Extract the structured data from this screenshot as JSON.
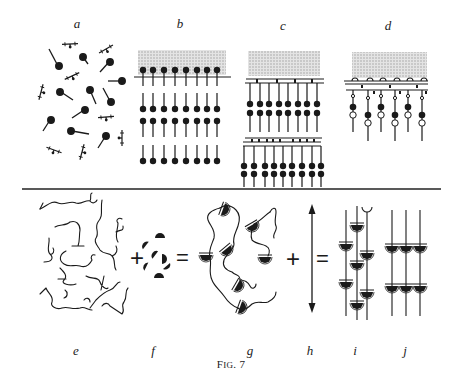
{
  "figure": {
    "caption_prefix": "F",
    "caption_smallcaps": "IG",
    "caption_suffix": ". 7",
    "panels_top": [
      {
        "id": "a",
        "label": "a",
        "x": 77,
        "y": 18
      },
      {
        "id": "b",
        "label": "b",
        "x": 180,
        "y": 18
      },
      {
        "id": "c",
        "label": "c",
        "x": 283,
        "y": 20
      },
      {
        "id": "d",
        "label": "d",
        "x": 388,
        "y": 20
      }
    ],
    "panels_bottom": [
      {
        "id": "e",
        "label": "e",
        "x": 76,
        "y": 345
      },
      {
        "id": "f",
        "label": "f",
        "x": 153,
        "y": 345
      },
      {
        "id": "g",
        "label": "g",
        "x": 250,
        "y": 345
      },
      {
        "id": "h",
        "label": "h",
        "x": 310,
        "y": 345
      },
      {
        "id": "i",
        "label": "i",
        "x": 355,
        "y": 345
      },
      {
        "id": "j",
        "label": "j",
        "x": 405,
        "y": 345
      }
    ],
    "operators": {
      "plus_1": "+",
      "equals_1": "=",
      "plus_2": "+",
      "equals_2": "="
    },
    "colors": {
      "ink": "#1a1a1a",
      "shade": "#cfcfcf",
      "background": "#ffffff"
    }
  }
}
